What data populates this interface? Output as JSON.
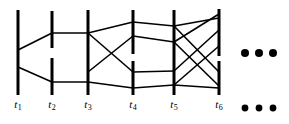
{
  "figure": {
    "background_color": "#ffffff",
    "line_color": "#000000",
    "bar_width": 3,
    "edge_width": 1.6
  },
  "chart_data": {
    "type": "diagram",
    "subtype": "time-expanded-graph",
    "title": "",
    "xlabel": "",
    "ylabel": "",
    "grid": false,
    "legend": null,
    "xlim": [
      0,
      289
    ],
    "ylim": [
      0,
      124
    ],
    "time_steps": [
      {
        "id": "t1",
        "label": "t",
        "subscript": "1",
        "x": 18,
        "label_x": 18,
        "bars": [
          {
            "y1": 10,
            "y2": 95
          }
        ]
      },
      {
        "id": "t2",
        "label": "t",
        "subscript": "2",
        "x": 52,
        "label_x": 52,
        "bars": [
          {
            "y1": 11,
            "y2": 48
          },
          {
            "y1": 58,
            "y2": 95
          }
        ]
      },
      {
        "id": "t3",
        "label": "t",
        "subscript": "3",
        "x": 88,
        "label_x": 88,
        "bars": [
          {
            "y1": 10,
            "y2": 95
          }
        ]
      },
      {
        "id": "t4",
        "label": "t",
        "subscript": "4",
        "x": 133,
        "label_x": 133,
        "bars": [
          {
            "y1": 10,
            "y2": 54
          },
          {
            "y1": 61,
            "y2": 95
          }
        ]
      },
      {
        "id": "t5",
        "label": "t",
        "subscript": "5",
        "x": 174,
        "label_x": 174,
        "bars": [
          {
            "y1": 10,
            "y2": 95
          }
        ]
      },
      {
        "id": "t6",
        "label": "t",
        "subscript": "6",
        "x": 219,
        "label_x": 219,
        "bars": [
          {
            "y1": 9,
            "y2": 56
          },
          {
            "y1": 61,
            "y2": 95
          }
        ]
      }
    ],
    "edges": [
      {
        "from": "t1",
        "to": "t2",
        "x1": 18,
        "y1": 50,
        "x2": 52,
        "y2": 33
      },
      {
        "from": "t1",
        "to": "t2",
        "x1": 18,
        "y1": 67,
        "x2": 52,
        "y2": 82
      },
      {
        "from": "t2",
        "to": "t3",
        "x1": 52,
        "y1": 33,
        "x2": 88,
        "y2": 33
      },
      {
        "from": "t2",
        "to": "t3",
        "x1": 52,
        "y1": 82,
        "x2": 88,
        "y2": 82
      },
      {
        "from": "t3",
        "to": "t4",
        "x1": 88,
        "y1": 33,
        "x2": 133,
        "y2": 22
      },
      {
        "from": "t3",
        "to": "t4",
        "x1": 88,
        "y1": 33,
        "x2": 133,
        "y2": 72
      },
      {
        "from": "t3",
        "to": "t4",
        "x1": 88,
        "y1": 72,
        "x2": 133,
        "y2": 36
      },
      {
        "from": "t3",
        "to": "t4",
        "x1": 88,
        "y1": 82,
        "x2": 133,
        "y2": 88
      },
      {
        "from": "t4",
        "to": "t5",
        "x1": 133,
        "y1": 22,
        "x2": 174,
        "y2": 26
      },
      {
        "from": "t4",
        "to": "t5",
        "x1": 133,
        "y1": 36,
        "x2": 174,
        "y2": 42
      },
      {
        "from": "t4",
        "to": "t5",
        "x1": 133,
        "y1": 72,
        "x2": 174,
        "y2": 71
      },
      {
        "from": "t4",
        "to": "t5",
        "x1": 133,
        "y1": 88,
        "x2": 174,
        "y2": 85
      },
      {
        "from": "t5",
        "to": "t6",
        "x1": 174,
        "y1": 26,
        "x2": 219,
        "y2": 18
      },
      {
        "from": "t5",
        "to": "t6",
        "x1": 174,
        "y1": 26,
        "x2": 219,
        "y2": 72
      },
      {
        "from": "t5",
        "to": "t6",
        "x1": 174,
        "y1": 42,
        "x2": 219,
        "y2": 14
      },
      {
        "from": "t5",
        "to": "t6",
        "x1": 174,
        "y1": 42,
        "x2": 219,
        "y2": 86
      },
      {
        "from": "t5",
        "to": "t6",
        "x1": 174,
        "y1": 71,
        "x2": 219,
        "y2": 30
      },
      {
        "from": "t5",
        "to": "t6",
        "x1": 174,
        "y1": 85,
        "x2": 219,
        "y2": 46
      },
      {
        "from": "t5",
        "to": "t6",
        "x1": 174,
        "y1": 85,
        "x2": 219,
        "y2": 88
      }
    ],
    "ellipses": [
      {
        "id": "upper-ellipsis",
        "y": 53,
        "dots": [
          {
            "cx": 245,
            "cy": 53,
            "r": 4
          },
          {
            "cx": 259,
            "cy": 53,
            "r": 4
          },
          {
            "cx": 273,
            "cy": 53,
            "r": 4
          }
        ]
      },
      {
        "id": "lower-ellipsis",
        "y": 108,
        "dots": [
          {
            "cx": 245,
            "cy": 108,
            "r": 3.4
          },
          {
            "cx": 259,
            "cy": 108,
            "r": 3.4
          },
          {
            "cx": 273,
            "cy": 108,
            "r": 3.4
          }
        ]
      }
    ],
    "axis_tick_labels": [
      "t1",
      "t2",
      "t3",
      "t4",
      "t5",
      "t6"
    ],
    "tick_label_baseline_y": 108
  }
}
